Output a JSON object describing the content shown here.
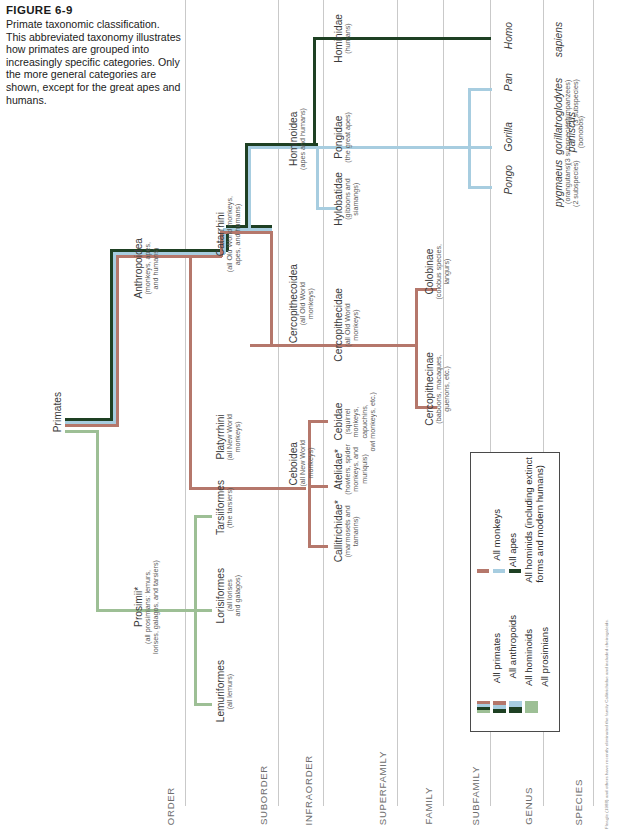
{
  "figure": {
    "number": "FIGURE 6-9",
    "caption": "Primate taxonomic classification. This abbreviated taxonomy illustrates how primates are grouped into increasingly specific categories. Only the more general categories are shown, except for the great apes and humans."
  },
  "colors": {
    "monkeys": "#b5776b",
    "apes": "#a7cde0",
    "hominids": "#1e4023",
    "prosimians": "#9dbf95",
    "primates_band": "#8d8f7e",
    "rule": "#c9c9c9",
    "legend_border": "#4a4a4a"
  },
  "columns": [
    {
      "key": "order",
      "label": "ORDER"
    },
    {
      "key": "suborder",
      "label": "SUBORDER"
    },
    {
      "key": "infraorder",
      "label": "INFRAORDER"
    },
    {
      "key": "superfamily",
      "label": "SUPERFAMILY"
    },
    {
      "key": "family",
      "label": "FAMILY"
    },
    {
      "key": "subfamily",
      "label": "SUBFAMILY"
    },
    {
      "key": "genus",
      "label": "GENUS"
    },
    {
      "key": "species",
      "label": "SPECIES"
    }
  ],
  "nodes": {
    "primates": {
      "name": "Primates",
      "detail": ""
    },
    "prosimii": {
      "name": "Prosimii*",
      "detail": "(all prosimians: lemurs,\nlorises, galagos, and tarsiers)"
    },
    "anthropoidea": {
      "name": "Anthropoidea",
      "detail": "(monkeys, apes,\nand humans)"
    },
    "lemuriformes": {
      "name": "Lemuriformes",
      "detail": "(all lemurs)"
    },
    "lorisiformes": {
      "name": "Lorisiformes",
      "detail": "(all lorises\nand galagos)"
    },
    "tarsiiformes": {
      "name": "Tarsiiformes",
      "detail": "(the tarsiers)"
    },
    "platyrrhini": {
      "name": "Platyrrhini",
      "detail": "(all New World\nmonkeys)"
    },
    "catarrhini": {
      "name": "Catarrhini",
      "detail": "(all Old World monkeys,\napes, and humans)"
    },
    "ceboidea": {
      "name": "Ceboidea",
      "detail": "(all New World\nmonkeys)"
    },
    "cercopithecoidea": {
      "name": "Cercopithecoidea",
      "detail": "(all Old World\nmonkeys)"
    },
    "hominoidea": {
      "name": "Hominoidea",
      "detail": "(apes and humans)"
    },
    "callitrichidae": {
      "name": "Callitrichidae*",
      "detail": "(marmosets and\ntamarins)"
    },
    "atelidae": {
      "name": "Atelidae*",
      "detail": "(howlers, spider\nmonkeys, and\nmuriquis)"
    },
    "cebidae": {
      "name": "Cebidae",
      "detail": "(squirrel\nmonkeys,\ncapuchins,\nowl monkeys, etc.)"
    },
    "cercopithecidae": {
      "name": "Cercopithecidae",
      "detail": "(all Old World\nmonkeys)"
    },
    "hylobatidae": {
      "name": "Hylobatidae",
      "detail": "(gibbons and\nsiamangs)"
    },
    "pongidae": {
      "name": "Pongidae",
      "detail": "(the great apes)"
    },
    "hominidae": {
      "name": "Hominidae",
      "detail": "(humans)"
    },
    "cercopithecinae": {
      "name": "Cercopithecinae",
      "detail": "(baboons, macaques,\nguenons, etc.)"
    },
    "colobinae": {
      "name": "Colobinae",
      "detail": "(colobus species,\nlangurs)"
    },
    "pongo": {
      "name": "Pongo",
      "detail": ""
    },
    "gorilla": {
      "name": "Gorilla",
      "detail": ""
    },
    "pan": {
      "name": "Pan",
      "detail": ""
    },
    "homo": {
      "name": "Homo",
      "detail": ""
    },
    "pygmaeus": {
      "name": "pygmaeus",
      "detail": "(orangutans)\n(2 subspecies)"
    },
    "gorilla_sp": {
      "name": "gorilla",
      "detail": "(3 subspecies)"
    },
    "troglodytes": {
      "name": "troglodytes",
      "detail": "(chimpanzees)\n(3 subspecies)"
    },
    "paniscus": {
      "name": "paniscus",
      "detail": "(bonobos)"
    },
    "sapiens": {
      "name": "sapiens",
      "detail": ""
    }
  },
  "legend": {
    "left_column": [
      {
        "label": "All primates",
        "bands": [
          "#b5776b",
          "#a7cde0",
          "#1e4023",
          "#9dbf95"
        ]
      },
      {
        "label": "All anthropoids",
        "bands": [
          "#b5776b",
          "#a7cde0",
          "#1e4023"
        ]
      },
      {
        "label": "All hominoids",
        "bands": [
          "#a7cde0",
          "#1e4023"
        ]
      },
      {
        "label": "All prosimians",
        "bands": [
          "#9dbf95"
        ]
      }
    ],
    "right_column": [
      {
        "label": "All monkeys",
        "color": "#b5776b"
      },
      {
        "label": "All apes",
        "color": "#a7cde0"
      },
      {
        "label": "All hominids (including extinct\nforms and modern humans)",
        "color": "#1e4023"
      }
    ]
  },
  "footnote": "Fleagle (1988) and others have recently eliminated the family Callitrichidae and included cheirogaleids."
}
